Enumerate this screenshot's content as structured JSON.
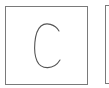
{
  "tiles": [
    {
      "letter": "C",
      "selected": false
    },
    {
      "letter": "",
      "selected": false
    }
  ],
  "colors": {
    "border": "#7a7a7a",
    "glyph_stroke": "#555555",
    "background": "#ffffff"
  }
}
